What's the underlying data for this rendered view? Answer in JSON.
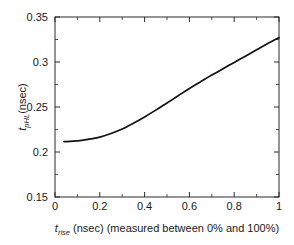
{
  "chart_data": {
    "type": "line",
    "title": "",
    "subtitle": "",
    "xlabel_parts": {
      "symbol": "t",
      "symbol_sub": "rise",
      "rest": " (nsec) (measured between 0% and 100%)"
    },
    "ylabel_parts": {
      "symbol": "t",
      "symbol_sub": "pHL",
      "rest": "(nsec)"
    },
    "xlabel": "t_rise (nsec) (measured between 0% and 100%)",
    "ylabel": "t_pHL (nsec)",
    "xlim": [
      0,
      1
    ],
    "ylim": [
      0.15,
      0.35
    ],
    "xticks": [
      0,
      0.2,
      0.4,
      0.6,
      0.8,
      1
    ],
    "xtick_labels": [
      "0",
      "0.2",
      "0.4",
      "0.6",
      "0.8",
      "1"
    ],
    "yticks": [
      0.15,
      0.2,
      0.25,
      0.3,
      0.35
    ],
    "ytick_labels": [
      "0.15",
      "0.2",
      "0.25",
      "0.3",
      "0.35"
    ],
    "x_minor_ticks": [
      0.1,
      0.3,
      0.5,
      0.7,
      0.9
    ],
    "y_minor_ticks": [
      0.175,
      0.225,
      0.275,
      0.325
    ],
    "grid": false,
    "legend": null,
    "line_color": "#111111",
    "background_color": "#ffffff",
    "frame_color": "#2b2b2b",
    "series": [
      {
        "name": "t_pHL vs t_rise",
        "x": [
          0.04,
          0.08,
          0.12,
          0.16,
          0.2,
          0.25,
          0.3,
          0.35,
          0.4,
          0.45,
          0.5,
          0.55,
          0.6,
          0.65,
          0.7,
          0.75,
          0.8,
          0.85,
          0.9,
          0.95,
          1.0
        ],
        "y": [
          0.2115,
          0.212,
          0.213,
          0.2145,
          0.2165,
          0.2205,
          0.2255,
          0.232,
          0.239,
          0.2465,
          0.2545,
          0.2625,
          0.2705,
          0.278,
          0.2855,
          0.2925,
          0.2995,
          0.3065,
          0.3135,
          0.3205,
          0.327
        ]
      }
    ]
  }
}
